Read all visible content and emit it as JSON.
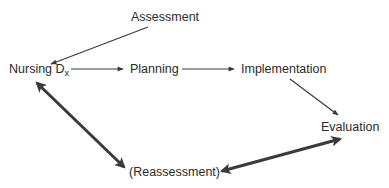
{
  "diagram": {
    "type": "process-cycle",
    "nodes": {
      "assessment": {
        "label": "Assessment"
      },
      "nursing_dx": {
        "label": "Nursing D",
        "subscript": "x"
      },
      "planning": {
        "label": "Planning"
      },
      "implementation": {
        "label": "Implementation"
      },
      "evaluation": {
        "label": "Evaluation"
      },
      "reassessment": {
        "label": "(Reassessment)"
      }
    },
    "edges": [
      {
        "from": "Assessment",
        "to": "Nursing Dx",
        "style": "thin",
        "direction": "one-way"
      },
      {
        "from": "Nursing Dx",
        "to": "Planning",
        "style": "thin",
        "direction": "one-way"
      },
      {
        "from": "Planning",
        "to": "Implementation",
        "style": "thin",
        "direction": "one-way"
      },
      {
        "from": "Implementation",
        "to": "Evaluation",
        "style": "thin",
        "direction": "one-way"
      },
      {
        "from": "Evaluation",
        "to": "(Reassessment)",
        "style": "thick",
        "direction": "two-way"
      },
      {
        "from": "(Reassessment)",
        "to": "Nursing Dx",
        "style": "thick",
        "direction": "two-way"
      }
    ],
    "colors": {
      "text": "#2b2b2b",
      "arrow": "#3a3a3a",
      "background": "#ffffff"
    }
  }
}
